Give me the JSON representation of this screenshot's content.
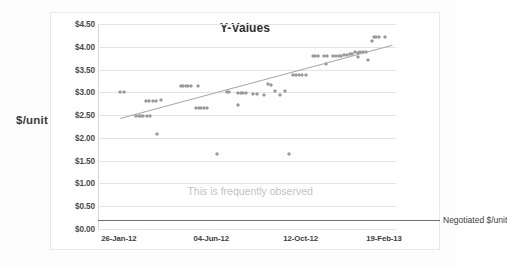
{
  "chart_data": {
    "type": "scatter",
    "title": "Y-Values",
    "xlabel": "",
    "ylabel": "$/unit",
    "ylim": [
      0,
      4.5
    ],
    "ytick_labels": [
      "$0.00",
      "$0.50",
      "$1.00",
      "$1.50",
      "$2.00",
      "$2.50",
      "$3.00",
      "$3.50",
      "$4.00",
      "$4.50"
    ],
    "ytick_values": [
      0,
      0.5,
      1.0,
      1.5,
      2.0,
      2.5,
      3.0,
      3.5,
      4.0,
      4.5
    ],
    "xtick_labels": [
      "26-Jan-12",
      "04-Jun-12",
      "12-Oct-12",
      "19-Feb-13"
    ],
    "xtick_positions": [
      0.07,
      0.38,
      0.68,
      0.96
    ],
    "grid": "horizontal",
    "legend": "none",
    "series": [
      {
        "name": "Y-Values",
        "marker": "diamond",
        "color": "#9a9a9e",
        "points": [
          [
            0.075,
            3.0
          ],
          [
            0.088,
            3.0
          ],
          [
            0.128,
            2.47
          ],
          [
            0.136,
            2.47
          ],
          [
            0.143,
            2.47
          ],
          [
            0.152,
            2.47
          ],
          [
            0.165,
            2.48
          ],
          [
            0.174,
            2.48
          ],
          [
            0.162,
            2.82
          ],
          [
            0.171,
            2.82
          ],
          [
            0.186,
            2.82
          ],
          [
            0.195,
            2.82
          ],
          [
            0.212,
            2.83
          ],
          [
            0.198,
            2.09
          ],
          [
            0.277,
            3.15
          ],
          [
            0.286,
            3.15
          ],
          [
            0.294,
            3.15
          ],
          [
            0.303,
            3.15
          ],
          [
            0.312,
            3.15
          ],
          [
            0.335,
            3.15
          ],
          [
            0.33,
            2.66
          ],
          [
            0.339,
            2.66
          ],
          [
            0.347,
            2.66
          ],
          [
            0.356,
            2.66
          ],
          [
            0.365,
            2.66
          ],
          [
            0.398,
            1.65
          ],
          [
            0.432,
            3.0
          ],
          [
            0.441,
            3.0
          ],
          [
            0.47,
            2.99
          ],
          [
            0.479,
            2.99
          ],
          [
            0.488,
            2.99
          ],
          [
            0.497,
            2.99
          ],
          [
            0.47,
            2.73
          ],
          [
            0.52,
            2.96
          ],
          [
            0.535,
            2.96
          ],
          [
            0.556,
            2.95
          ],
          [
            0.57,
            3.18
          ],
          [
            0.579,
            3.17
          ],
          [
            0.594,
            3.04
          ],
          [
            0.612,
            2.95
          ],
          [
            0.628,
            3.04
          ],
          [
            0.641,
            1.65
          ],
          [
            0.655,
            3.38
          ],
          [
            0.664,
            3.38
          ],
          [
            0.673,
            3.38
          ],
          [
            0.686,
            3.38
          ],
          [
            0.697,
            3.38
          ],
          [
            0.72,
            3.8
          ],
          [
            0.729,
            3.8
          ],
          [
            0.738,
            3.8
          ],
          [
            0.757,
            3.8
          ],
          [
            0.77,
            3.8
          ],
          [
            0.766,
            3.63
          ],
          [
            0.79,
            3.8
          ],
          [
            0.799,
            3.8
          ],
          [
            0.808,
            3.8
          ],
          [
            0.817,
            3.8
          ],
          [
            0.826,
            3.81
          ],
          [
            0.835,
            3.81
          ],
          [
            0.845,
            3.84
          ],
          [
            0.854,
            3.85
          ],
          [
            0.862,
            3.88
          ],
          [
            0.871,
            3.87
          ],
          [
            0.88,
            3.88
          ],
          [
            0.889,
            3.88
          ],
          [
            0.898,
            3.88
          ],
          [
            0.872,
            3.77
          ],
          [
            0.906,
            3.7
          ],
          [
            0.918,
            4.13
          ],
          [
            0.925,
            4.22
          ],
          [
            0.934,
            4.22
          ],
          [
            0.943,
            4.22
          ],
          [
            0.962,
            4.22
          ]
        ]
      }
    ],
    "trendline": {
      "label": "linear trend",
      "color": "#a9a9ad",
      "x_start": 0.075,
      "y_start": 2.44,
      "x_end": 0.99,
      "y_end": 4.05
    },
    "reference_line": {
      "label": "Negotiated $/unit",
      "value": 0.19,
      "color": "#6e6e72"
    },
    "annotation": {
      "text": "This is frequently observed",
      "x": 0.3,
      "y": 0.96,
      "color": "#c2c2c4"
    }
  }
}
